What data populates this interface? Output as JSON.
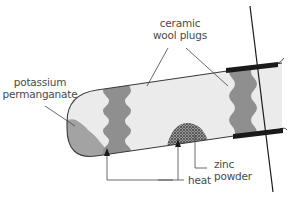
{
  "diagram": {
    "title": "",
    "colors": {
      "tube_fill": "#ebebeb",
      "tube_outline": "#3a3a3a",
      "plug_fill": "#8f8f8f",
      "permanganate_fill": "#a3a3a3",
      "clamp": "#1a1a1a",
      "zinc": "#6e6e6e",
      "label_text": "#4a4a4a"
    },
    "labels": {
      "potassium_permanganate": [
        "potassium",
        "permanganate"
      ],
      "ceramic_wool_plugs": [
        "ceramic",
        "wool plugs"
      ],
      "zinc_powder": [
        "zinc",
        "powder"
      ],
      "heat": "heat"
    },
    "components": [
      {
        "name": "test tube",
        "description": "horizontal boiling tube, closed rounded end on left"
      },
      {
        "name": "potassium permanganate",
        "position": "left closed end"
      },
      {
        "name": "ceramic wool plug",
        "position": "left-middle"
      },
      {
        "name": "zinc powder",
        "position": "centre, on tube floor"
      },
      {
        "name": "ceramic wool plug",
        "position": "right, near open end"
      },
      {
        "name": "clamp",
        "position": "right open end, with stand rod"
      }
    ],
    "arrows": [
      {
        "from": "heat label",
        "to": "tube under potassium permanganate"
      },
      {
        "from": "heat label",
        "to": "tube under zinc powder"
      }
    ]
  }
}
